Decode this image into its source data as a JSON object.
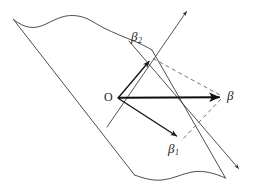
{
  "figure": {
    "background_color": "#ffffff",
    "stroke_color": "#2b2b2b",
    "vector_color": "#111111",
    "dashed_color": "#555555",
    "width": 256,
    "height": 191
  },
  "labels": {
    "origin": "O",
    "beta": "β",
    "beta1_base": "β",
    "beta1_sub": "1",
    "beta2_base": "β",
    "beta2_sub": "2"
  },
  "geometry": {
    "plane": {
      "name": "parallelogram-plane",
      "corner_top_left": [
        13,
        19
      ],
      "corner_top_right": [
        152,
        50
      ],
      "corner_bottom_right": [
        225,
        178
      ],
      "corner_bottom_left": [
        134,
        175
      ],
      "top_edge_style": "wavy",
      "bottom_edge_style": "wavy",
      "left_edge_style": "straight",
      "right_edge_style": "straight"
    },
    "vectors": [
      {
        "name": "beta",
        "from": [
          118,
          98
        ],
        "to": [
          222,
          97
        ],
        "weight": "thick",
        "style": "solid",
        "label": "β"
      },
      {
        "name": "beta-2",
        "from": [
          118,
          98
        ],
        "to": [
          150,
          60
        ],
        "weight": "medium",
        "style": "solid",
        "label": "β₂"
      },
      {
        "name": "beta-1",
        "from": [
          118,
          98
        ],
        "to": [
          178,
          137
        ],
        "weight": "medium",
        "style": "solid",
        "label": "β₁"
      }
    ],
    "dashed_lines": [
      {
        "name": "dashed-beta2-to-beta",
        "from": [
          152,
          58
        ],
        "to": [
          222,
          97
        ]
      },
      {
        "name": "dashed-beta-to-beta1",
        "from": [
          222,
          97
        ],
        "to": [
          180,
          140
        ]
      }
    ],
    "axis_lines": [
      {
        "name": "axis-line-up-right",
        "from": [
          108,
          126
        ],
        "to": [
          188,
          9
        ],
        "arrow_at": "end"
      },
      {
        "name": "axis-line-down-right",
        "from": [
          130,
          42
        ],
        "to": [
          241,
          171
        ],
        "arrow_at": "end"
      }
    ]
  },
  "label_positions": {
    "origin": [
      104,
      92
    ],
    "beta": [
      227,
      89
    ],
    "beta1": [
      168,
      143
    ],
    "beta2": [
      131,
      31
    ]
  }
}
